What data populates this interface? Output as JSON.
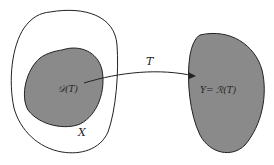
{
  "diagram": {
    "labels": {
      "domain": "𝒟(T)",
      "space_x": "X",
      "map_t": "T",
      "range": "Y= ℛ(T)"
    },
    "colors": {
      "fill": "#8a8a8a",
      "stroke": "#222222",
      "background": "#ffffff"
    }
  }
}
